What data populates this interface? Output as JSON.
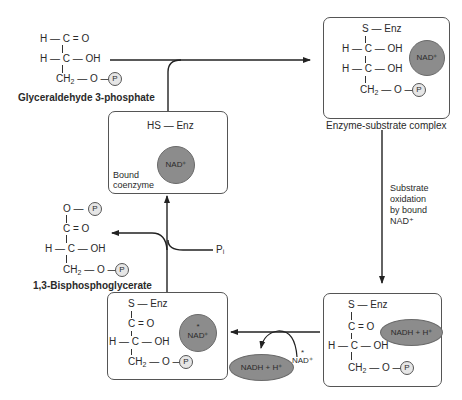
{
  "molecules": {
    "glyceraldehyde_3_phosphate": {
      "lines": [
        "H — C = O",
        "H — C — OH",
        "CH₂ — O — P"
      ],
      "label": "Glyceraldehyde 3-phosphate"
    },
    "bisphosphoglycerate": {
      "lines": [
        "O — P",
        "C = O",
        "H — C — OH",
        "CH₂ — O — P"
      ],
      "label": "1,3-Bisphosphoglycerate"
    }
  },
  "boxes": {
    "free_enzyme": {
      "group": "HS — Enz",
      "coenzyme": "NAD⁺",
      "annotation_line1": "Bound",
      "annotation_line2": "coenzyme"
    },
    "enzyme_substrate_complex": {
      "lines": [
        "S — Enz",
        "H — C — OH",
        "H — C — OH",
        "CH₂ — O — P"
      ],
      "coenzyme": "NAD⁺",
      "label": "Enzyme-substrate complex"
    },
    "reduced_complex": {
      "lines": [
        "S — Enz",
        "C = O",
        "H — C — OH",
        "CH₂ — O — P"
      ],
      "coenzyme": "NADH + H⁺"
    },
    "exchanged_complex": {
      "lines": [
        "S — Enz",
        "C = O",
        "H — C — OH",
        "CH₂ — O — P"
      ],
      "coenzyme": "NAD⁺",
      "coenzyme_mark": "*"
    }
  },
  "step_labels": {
    "oxidation_line1": "Substrate",
    "oxidation_line2": "oxidation",
    "oxidation_line3": "by bound",
    "oxidation_line4": "NAD⁺",
    "phosphate_in": "Pᵢ",
    "nadh_out": "NADH + H⁺",
    "nad_in": "NAD⁺",
    "nad_in_mark": "*"
  },
  "phosphate_symbol": "P",
  "colors": {
    "coenzyme_fill": "#8c8c8c",
    "coenzyme_stroke": "#6a6a6a",
    "phosphate_fill": "#e6e6e6",
    "line": "#222222"
  }
}
